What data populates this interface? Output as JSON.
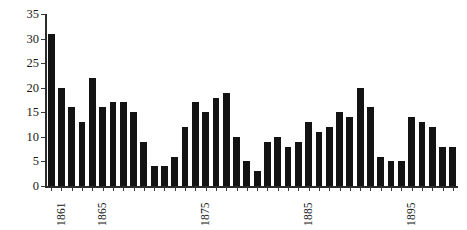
{
  "chart_data": {
    "type": "bar",
    "title": "",
    "subtitle": "",
    "xlabel": "",
    "ylabel": "",
    "ylim": [
      0,
      35
    ],
    "y_ticks": [
      0,
      5,
      10,
      15,
      20,
      25,
      30,
      35
    ],
    "y_tick_labels": [
      "0",
      "5",
      "10",
      "15",
      "20",
      "25",
      "30",
      "35"
    ],
    "grid": false,
    "legend": null,
    "legend_position": "none",
    "bar_color": "#131313",
    "axis_color": "#2b2b2b",
    "background_color": "#ffffff",
    "categories": [
      "1861",
      "1862",
      "1863",
      "1864",
      "1865",
      "1866",
      "1867",
      "1868",
      "1869",
      "1870",
      "1871",
      "1872",
      "1873",
      "1874",
      "1875",
      "1876",
      "1877",
      "1878",
      "1879",
      "1880",
      "1881",
      "1882",
      "1883",
      "1884",
      "1885",
      "1886",
      "1887",
      "1888",
      "1889",
      "1890",
      "1891",
      "1892",
      "1893",
      "1894",
      "1895",
      "1896",
      "1897",
      "1898",
      "1899",
      "1900"
    ],
    "values": [
      31,
      20,
      16,
      13,
      22,
      16,
      17,
      17,
      15,
      9,
      4,
      4,
      6,
      12,
      17,
      15,
      18,
      19,
      10,
      5,
      3,
      9,
      10,
      8,
      9,
      13,
      11,
      12,
      15,
      14,
      20,
      16,
      6,
      5,
      5,
      14,
      13,
      12,
      8,
      8
    ],
    "x_tick_labels": [
      "1861",
      "1865",
      "1875",
      "1885",
      "1895"
    ],
    "x_tick_indices": [
      0,
      4,
      14,
      24,
      34
    ]
  }
}
